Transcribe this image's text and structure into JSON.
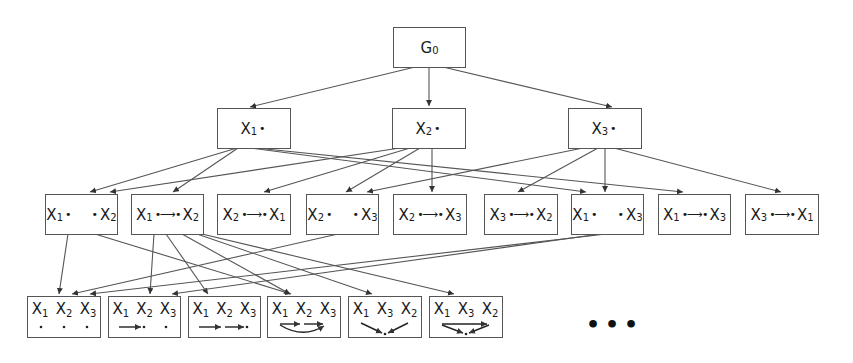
{
  "diagram": {
    "root": {
      "label": "G",
      "sub": "0"
    },
    "level1": [
      {
        "var": "X",
        "sub": "1"
      },
      {
        "var": "X",
        "sub": "2"
      },
      {
        "var": "X",
        "sub": "3"
      }
    ],
    "level2": [
      {
        "a": "X",
        "a_sub": "1",
        "b": "X",
        "b_sub": "2",
        "edge": "none"
      },
      {
        "a": "X",
        "a_sub": "1",
        "b": "X",
        "b_sub": "2",
        "edge": "arrow"
      },
      {
        "a": "X",
        "a_sub": "2",
        "b": "X",
        "b_sub": "1",
        "edge": "arrow"
      },
      {
        "a": "X",
        "a_sub": "2",
        "b": "X",
        "b_sub": "3",
        "edge": "none"
      },
      {
        "a": "X",
        "a_sub": "2",
        "b": "X",
        "b_sub": "3",
        "edge": "arrow"
      },
      {
        "a": "X",
        "a_sub": "3",
        "b": "X",
        "b_sub": "2",
        "edge": "arrow"
      },
      {
        "a": "X",
        "a_sub": "1",
        "b": "X",
        "b_sub": "3",
        "edge": "none"
      },
      {
        "a": "X",
        "a_sub": "1",
        "b": "X",
        "b_sub": "3",
        "edge": "arrow"
      },
      {
        "a": "X",
        "a_sub": "3",
        "b": "X",
        "b_sub": "1",
        "edge": "arrow"
      }
    ],
    "level3": [
      {
        "vars": [
          [
            "X",
            "1"
          ],
          [
            "X",
            "2"
          ],
          [
            "X",
            "3"
          ]
        ],
        "graph": "empty"
      },
      {
        "vars": [
          [
            "X",
            "1"
          ],
          [
            "X",
            "2"
          ],
          [
            "X",
            "3"
          ]
        ],
        "graph": "x1_to_x2"
      },
      {
        "vars": [
          [
            "X",
            "1"
          ],
          [
            "X",
            "2"
          ],
          [
            "X",
            "3"
          ]
        ],
        "graph": "chain"
      },
      {
        "vars": [
          [
            "X",
            "1"
          ],
          [
            "X",
            "2"
          ],
          [
            "X",
            "3"
          ]
        ],
        "graph": "chain_plus_x1_x3"
      },
      {
        "vars": [
          [
            "X",
            "1"
          ],
          [
            "X",
            "3"
          ],
          [
            "X",
            "2"
          ]
        ],
        "graph": "collider"
      },
      {
        "vars": [
          [
            "X",
            "1"
          ],
          [
            "X",
            "3"
          ],
          [
            "X",
            "2"
          ]
        ],
        "graph": "collider_plus_x1_x2"
      }
    ],
    "ellipsis": "•••",
    "colors": {
      "stroke": "#555555",
      "text": "#1a1a1a",
      "background": "#ffffff"
    }
  }
}
